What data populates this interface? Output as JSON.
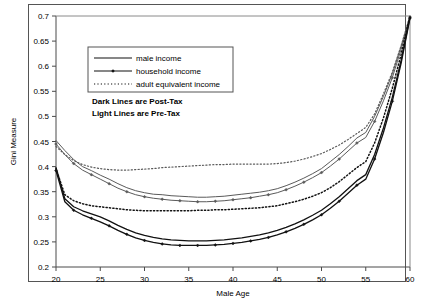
{
  "chart_data": {
    "type": "line",
    "title": "",
    "xlabel": "Male Age",
    "ylabel": "Gini Measure",
    "xlim": [
      20,
      60
    ],
    "ylim": [
      0.2,
      0.7
    ],
    "xticks": [
      20,
      25,
      30,
      35,
      40,
      45,
      50,
      55,
      60
    ],
    "xtick_labels": [
      "20",
      "25",
      "30",
      "35",
      "40",
      "45",
      "50",
      "55",
      "60"
    ],
    "yticks": [
      0.2,
      0.25,
      0.3,
      0.35,
      0.4,
      0.45,
      0.5,
      0.55,
      0.6,
      0.65,
      0.7
    ],
    "ytick_labels": [
      "0.2",
      "0.25",
      "0.3",
      "0.35",
      "0.4",
      "0.45",
      "0.5",
      "0.55",
      "0.6",
      "0.65",
      "0.7"
    ],
    "grid": false,
    "legend_position": "upper-center",
    "legend_entries": [
      {
        "label": "male income",
        "style": "solid",
        "marker": "none"
      },
      {
        "label": "household income",
        "style": "solid",
        "marker": "diamond"
      },
      {
        "label": "adult equivalent income",
        "style": "dotted",
        "marker": "none"
      }
    ],
    "annotations": [
      "Dark Lines are Post-Tax",
      "Light Lines are Pre-Tax"
    ],
    "x": [
      20,
      21,
      22,
      23,
      24,
      25,
      26,
      27,
      28,
      29,
      30,
      31,
      32,
      33,
      34,
      35,
      36,
      37,
      38,
      39,
      40,
      41,
      42,
      43,
      44,
      45,
      46,
      47,
      48,
      49,
      50,
      51,
      52,
      53,
      54,
      55,
      56,
      57,
      58,
      59,
      60
    ],
    "series": [
      {
        "name": "male income pre-tax",
        "style": "solid",
        "marker": "none",
        "shade": "light",
        "values": [
          0.452,
          0.432,
          0.414,
          0.4,
          0.392,
          0.383,
          0.375,
          0.366,
          0.358,
          0.352,
          0.348,
          0.345,
          0.344,
          0.342,
          0.341,
          0.34,
          0.339,
          0.339,
          0.34,
          0.341,
          0.343,
          0.345,
          0.347,
          0.349,
          0.352,
          0.356,
          0.362,
          0.369,
          0.377,
          0.386,
          0.396,
          0.41,
          0.424,
          0.44,
          0.457,
          0.468,
          0.5,
          0.54,
          0.585,
          0.64,
          0.7
        ]
      },
      {
        "name": "household income pre-tax",
        "style": "solid",
        "marker": "diamond",
        "shade": "light",
        "values": [
          0.445,
          0.424,
          0.406,
          0.393,
          0.384,
          0.375,
          0.366,
          0.357,
          0.35,
          0.344,
          0.34,
          0.337,
          0.335,
          0.333,
          0.332,
          0.331,
          0.33,
          0.33,
          0.331,
          0.332,
          0.334,
          0.336,
          0.338,
          0.341,
          0.344,
          0.348,
          0.354,
          0.361,
          0.369,
          0.378,
          0.388,
          0.401,
          0.415,
          0.431,
          0.447,
          0.458,
          0.49,
          0.531,
          0.577,
          0.634,
          0.698
        ]
      },
      {
        "name": "adult equivalent income pre-tax",
        "style": "dotted",
        "marker": "none",
        "shade": "light",
        "values": [
          0.44,
          0.424,
          0.412,
          0.404,
          0.399,
          0.396,
          0.394,
          0.393,
          0.393,
          0.394,
          0.395,
          0.396,
          0.398,
          0.399,
          0.4,
          0.401,
          0.402,
          0.403,
          0.404,
          0.404,
          0.405,
          0.405,
          0.405,
          0.405,
          0.405,
          0.406,
          0.408,
          0.411,
          0.415,
          0.42,
          0.426,
          0.434,
          0.443,
          0.454,
          0.466,
          0.478,
          0.505,
          0.545,
          0.588,
          0.641,
          0.7
        ]
      },
      {
        "name": "male income post-tax",
        "style": "solid",
        "marker": "none",
        "shade": "dark",
        "values": [
          0.398,
          0.336,
          0.32,
          0.312,
          0.306,
          0.3,
          0.292,
          0.283,
          0.275,
          0.268,
          0.263,
          0.259,
          0.256,
          0.254,
          0.253,
          0.252,
          0.252,
          0.252,
          0.253,
          0.254,
          0.256,
          0.258,
          0.261,
          0.264,
          0.268,
          0.273,
          0.279,
          0.286,
          0.294,
          0.303,
          0.313,
          0.326,
          0.34,
          0.356,
          0.372,
          0.384,
          0.424,
          0.477,
          0.538,
          0.612,
          0.698
        ]
      },
      {
        "name": "household income post-tax",
        "style": "solid",
        "marker": "diamond",
        "shade": "dark",
        "values": [
          0.392,
          0.33,
          0.313,
          0.304,
          0.297,
          0.29,
          0.282,
          0.273,
          0.265,
          0.258,
          0.253,
          0.249,
          0.246,
          0.244,
          0.243,
          0.243,
          0.243,
          0.243,
          0.244,
          0.245,
          0.247,
          0.249,
          0.252,
          0.255,
          0.259,
          0.264,
          0.27,
          0.277,
          0.285,
          0.294,
          0.304,
          0.317,
          0.331,
          0.347,
          0.363,
          0.375,
          0.415,
          0.468,
          0.53,
          0.606,
          0.696
        ]
      },
      {
        "name": "adult equivalent income post-tax",
        "style": "dotted",
        "marker": "none",
        "shade": "dark",
        "values": [
          0.396,
          0.344,
          0.332,
          0.326,
          0.322,
          0.32,
          0.318,
          0.316,
          0.314,
          0.313,
          0.312,
          0.312,
          0.312,
          0.312,
          0.312,
          0.312,
          0.313,
          0.313,
          0.314,
          0.314,
          0.315,
          0.316,
          0.317,
          0.318,
          0.32,
          0.322,
          0.326,
          0.33,
          0.335,
          0.341,
          0.348,
          0.358,
          0.37,
          0.384,
          0.398,
          0.41,
          0.447,
          0.497,
          0.556,
          0.624,
          0.7
        ]
      }
    ]
  }
}
